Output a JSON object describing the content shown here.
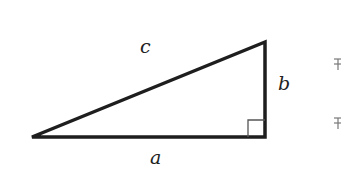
{
  "diagram": {
    "type": "right-triangle",
    "stroke_color": "#1e1e1e",
    "labels": {
      "hypotenuse": "c",
      "vertical_leg": "b",
      "horizontal_leg": "a"
    },
    "right_angle_marker": true,
    "vertices": {
      "left": [
        32,
        137
      ],
      "right_angle": [
        265,
        137
      ],
      "top": [
        265,
        42
      ]
    },
    "edge_glyphs": [
      "⥱",
      "⥱"
    ]
  }
}
